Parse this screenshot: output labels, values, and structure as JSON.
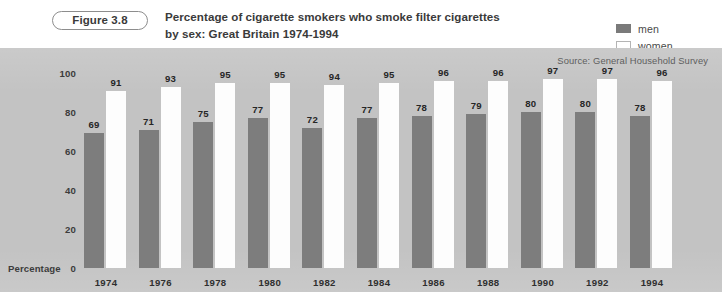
{
  "figure": {
    "badge": "Figure 3.8",
    "title_line_1": "Percentage of cigarette smokers who smoke filter cigarettes",
    "title_line_2": "by sex: Great Britain 1974-1994"
  },
  "legend": {
    "items": [
      {
        "label": "men",
        "color": "#7d7d7d"
      },
      {
        "label": "women",
        "color": "#ffffff"
      }
    ]
  },
  "source": "Source: General Household Survey",
  "axis": {
    "y_label": "Percentage",
    "y_ticks": [
      "0",
      "20",
      "40",
      "60",
      "80",
      "100"
    ]
  },
  "colors": {
    "panel_background": "#c3c3c3",
    "page_background": "#ffffff",
    "men_bar": "#7d7d7d",
    "women_bar": "#fdfdfd",
    "text": "#3a3a3a"
  },
  "chart_data": {
    "type": "bar",
    "title": "Percentage of cigarette smokers who smoke filter cigarettes by sex: Great Britain 1974-1994",
    "subtitle": "Source: General Household Survey",
    "xlabel": "",
    "ylabel": "Percentage",
    "ylim": [
      0,
      100
    ],
    "yticks": [
      0,
      20,
      40,
      60,
      80,
      100
    ],
    "grid": false,
    "legend_position": "top-right",
    "categories": [
      "1974",
      "1976",
      "1978",
      "1980",
      "1982",
      "1984",
      "1986",
      "1988",
      "1990",
      "1992",
      "1994"
    ],
    "series": [
      {
        "name": "men",
        "values": [
          69,
          71,
          75,
          77,
          72,
          77,
          78,
          79,
          80,
          80,
          78
        ]
      },
      {
        "name": "women",
        "values": [
          91,
          93,
          95,
          95,
          94,
          95,
          96,
          96,
          97,
          97,
          96
        ]
      }
    ]
  }
}
